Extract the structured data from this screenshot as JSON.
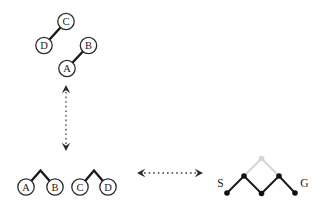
{
  "colors": {
    "background": "#ffffff",
    "ink": "#1a1a1a",
    "node_outline": "#2b2b2b",
    "dotted_arrow": "#3d3d3d",
    "gray_highlight": "#d5d5d5"
  },
  "abstract_chains": {
    "chain_dc": {
      "upper": "C",
      "lower": "D"
    },
    "chain_ab": {
      "upper": "B",
      "lower": "A"
    }
  },
  "abstract_pairs": {
    "pair_ab": {
      "left": "A",
      "right": "B"
    },
    "pair_cd": {
      "left": "C",
      "right": "D"
    }
  },
  "state_graph": {
    "start_label": "S",
    "goal_label": "G"
  },
  "icons": {
    "vertical_arrow": "dotted-double-headed-arrow-vertical",
    "horizontal_arrow": "dotted-double-headed-arrow-horizontal"
  }
}
